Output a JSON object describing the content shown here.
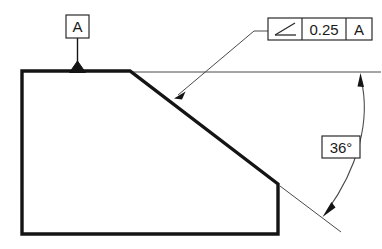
{
  "drawing": {
    "title": "Angularity tolerance on inclined surface",
    "background_color": "#ffffff",
    "line_color": "#1a1a1a",
    "thin_line_color": "#3c3c3c",
    "object_line_width": 3.2,
    "thin_line_width": 0.8
  },
  "part": {
    "name": "block-with-chamfered-corner",
    "outline_points": "22,71 130,71 278,184 278,234 22,234",
    "top_edge": {
      "x1": 22,
      "y1": 71,
      "x2": 130,
      "y2": 71
    },
    "left_edge": {
      "x1": 22,
      "y1": 71,
      "x2": 22,
      "y2": 234
    },
    "bottom_edge": {
      "x1": 22,
      "y1": 234,
      "x2": 278,
      "y2": 234
    },
    "right_edge": {
      "x1": 278,
      "y1": 184,
      "x2": 278,
      "y2": 234
    },
    "inclined_edge": {
      "x1": 130,
      "y1": 71,
      "x2": 278,
      "y2": 184
    }
  },
  "datum": {
    "label": "A",
    "box": {
      "x": 66,
      "y": 15,
      "width": 23,
      "height": 23
    },
    "leader": {
      "x1": 77.5,
      "y1": 38,
      "x2": 77.5,
      "y2": 66
    },
    "triangle": {
      "apex_x": 77.5,
      "apex_y": 64,
      "base_y": 72,
      "half_width": 8
    }
  },
  "feature_control_frame": {
    "symbol_name": "angularity-symbol",
    "tolerance": "0.25",
    "datum_reference": "A",
    "box": {
      "x": 268,
      "y": 18,
      "width": 104,
      "height": 22
    },
    "divider_1_x": 302,
    "divider_2_x": 346,
    "leader": {
      "horizontal": {
        "x1": 255,
        "y1": 31,
        "x2": 268,
        "y2": 31
      },
      "diagonal": {
        "x1": 255,
        "y1": 31,
        "x2": 176,
        "y2": 97
      }
    }
  },
  "angular_dimension": {
    "value": "36°",
    "box": {
      "x": 322,
      "y": 136,
      "width": 38,
      "height": 22
    },
    "extension_line_top": {
      "x1": 130,
      "y1": 72,
      "x2": 381,
      "y2": 72
    },
    "extension_line_bottom": {
      "x1": 280,
      "y1": 186,
      "x2": 340,
      "y2": 231
    },
    "arc": {
      "start_x": 361,
      "start_y": 79,
      "ctrl_x": 372,
      "ctrl_y": 130,
      "end_x": 326,
      "end_y": 212
    },
    "leader_to_box_top": {
      "x1": 352,
      "y1": 120,
      "x2": 345,
      "y2": 136
    },
    "leader_to_box_bottom": {
      "x1": 341,
      "y1": 158,
      "x2": 331,
      "y2": 196
    },
    "arrow_top": {
      "tip_x": 361,
      "tip_y": 74
    },
    "arrow_bottom": {
      "tip_x": 323,
      "tip_y": 216
    }
  }
}
